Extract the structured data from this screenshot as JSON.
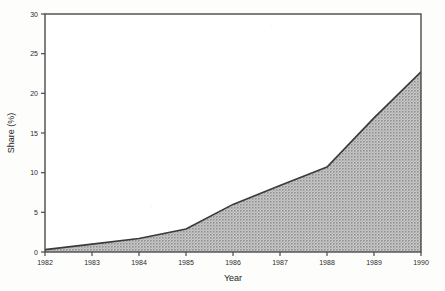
{
  "chart_data": {
    "type": "area",
    "title": "",
    "xlabel": "Year",
    "ylabel": "Share (%)",
    "x": [
      1982,
      1983,
      1984,
      1985,
      1986,
      1987,
      1988,
      1989,
      1990
    ],
    "values": [
      0.3,
      1.0,
      1.7,
      2.9,
      6.0,
      8.4,
      10.7,
      16.9,
      22.7
    ],
    "series": [
      {
        "name": "Share (%)",
        "values": [
          0.3,
          1.0,
          1.7,
          2.9,
          6.0,
          8.4,
          10.7,
          16.9,
          22.7
        ]
      }
    ],
    "xlim": [
      1982,
      1990
    ],
    "ylim": [
      0,
      30
    ],
    "xticks": [
      1982,
      1983,
      1984,
      1985,
      1986,
      1987,
      1988,
      1989,
      1990
    ],
    "yticks": [
      0,
      5,
      10,
      15,
      20,
      25,
      30
    ],
    "xtick_labels": [
      "1982",
      "1983",
      "1984",
      "1985",
      "1986",
      "1987",
      "1988",
      "1989",
      "1990"
    ],
    "ytick_labels": [
      "0",
      "5",
      "10",
      "15",
      "20",
      "25",
      "30"
    ],
    "grid": false,
    "legend": false,
    "legend_position": "none",
    "fill_color": "#a8a8a8",
    "line_color": "#3a3a3a",
    "axis_color": "#4a4a4a",
    "background_color": "#ffffff"
  }
}
